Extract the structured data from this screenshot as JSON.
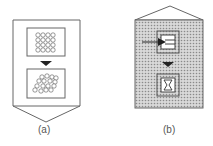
{
  "panels": [
    {
      "id": "a",
      "caption": "(a)",
      "shape": "pentagon-pointing-down",
      "fill": "#ffffff",
      "top_content": "ordered circle grid (4x4)",
      "bottom_content": "disordered circles"
    },
    {
      "id": "b",
      "caption": "(b)",
      "shape": "pentagon-pointing-up",
      "fill": "dotted-gray",
      "top_content": "box with incoming arrow and horizontal bars",
      "bottom_content": "box with hourglass symbol"
    }
  ],
  "colors": {
    "stroke": "#555555",
    "arrow": "#222222",
    "dots": "#9a9a9a"
  }
}
